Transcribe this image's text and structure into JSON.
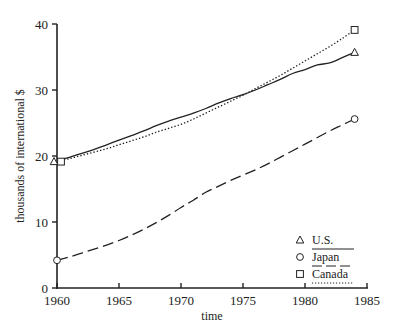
{
  "chart_data": {
    "type": "line",
    "title": "",
    "xlabel": "time",
    "ylabel": "thousands of international $",
    "xlim": [
      1960,
      1985
    ],
    "ylim": [
      0,
      40
    ],
    "xticks": [
      1960,
      1965,
      1970,
      1975,
      1980,
      1985
    ],
    "yticks": [
      0,
      10,
      20,
      30,
      40
    ],
    "grid": false,
    "legend_position": "lower right",
    "x": [
      1960,
      1961,
      1962,
      1963,
      1964,
      1965,
      1966,
      1967,
      1968,
      1969,
      1970,
      1971,
      1972,
      1973,
      1974,
      1975,
      1976,
      1977,
      1978,
      1979,
      1980,
      1981,
      1982,
      1983,
      1984
    ],
    "series": [
      {
        "name": "U.S.",
        "marker": "triangle",
        "line_style": "solid",
        "values": [
          19.3,
          19.8,
          20.4,
          21.0,
          21.7,
          22.4,
          23.1,
          23.8,
          24.6,
          25.3,
          25.9,
          26.5,
          27.2,
          28.0,
          28.7,
          29.3,
          30.0,
          30.8,
          31.6,
          32.5,
          33.1,
          33.8,
          34.1,
          34.9,
          35.7
        ]
      },
      {
        "name": "Japan",
        "marker": "circle",
        "line_style": "dashed",
        "values": [
          4.2,
          4.7,
          5.3,
          5.9,
          6.5,
          7.2,
          8.0,
          8.9,
          9.9,
          11.0,
          12.2,
          13.3,
          14.5,
          15.4,
          16.3,
          17.1,
          17.9,
          18.8,
          19.8,
          20.8,
          21.8,
          22.8,
          23.8,
          24.7,
          25.6
        ]
      },
      {
        "name": "Canada",
        "marker": "square",
        "line_style": "dotted",
        "values": [
          19.3,
          19.6,
          20.1,
          20.6,
          21.1,
          21.7,
          22.3,
          22.9,
          23.6,
          24.2,
          24.8,
          25.6,
          26.5,
          27.4,
          28.3,
          29.2,
          30.2,
          31.2,
          32.2,
          33.3,
          34.4,
          35.5,
          36.6,
          37.8,
          39.1
        ]
      }
    ]
  },
  "axes": {
    "x_title": "time",
    "y_title": "thousands of international $",
    "x_tick_labels": [
      "1960",
      "1965",
      "1970",
      "1975",
      "1980",
      "1985"
    ],
    "y_tick_labels": [
      "0",
      "10",
      "20",
      "30",
      "40"
    ]
  },
  "legend": {
    "items": [
      {
        "label": "U.S.",
        "marker": "triangle",
        "line_style": "solid"
      },
      {
        "label": "Japan",
        "marker": "circle",
        "line_style": "dashed"
      },
      {
        "label": "Canada",
        "marker": "square",
        "line_style": "dotted"
      }
    ]
  },
  "colors": {
    "line": "#222222",
    "background": "#ffffff"
  }
}
